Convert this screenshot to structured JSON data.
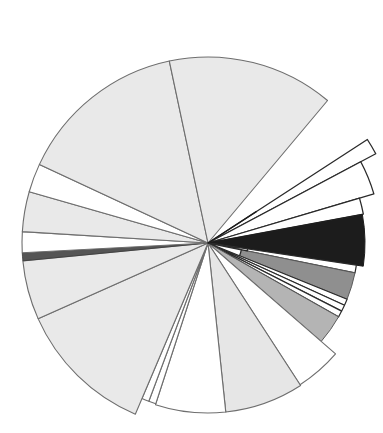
{
  "chart_data": {
    "type": "pie",
    "subtype": "polar-area-rose",
    "title": "",
    "subtitle": "",
    "xlabel": "",
    "ylabel": "",
    "legend": [],
    "annotations": [],
    "grid": false,
    "axis_visible": false,
    "tick_labels": [],
    "center": {
      "x": 208,
      "y": 243
    },
    "angle_units": "degrees",
    "angle_reference": "0 = east (right), increasing clockwise in screen space",
    "radius_units": "pixels",
    "radius_max": 190,
    "background_color": "#ffffff",
    "stroke_color": "#6e6e6e",
    "stroke_width": 1.1,
    "categories": [
      "S1",
      "S2",
      "S3",
      "S4",
      "S5",
      "S6",
      "S7",
      "S8",
      "S9",
      "S10",
      "S11",
      "S12",
      "S13",
      "S14",
      "S15",
      "S16",
      "S17",
      "S18",
      "S19",
      "S20",
      "S21",
      "S22",
      "S23"
    ],
    "series": [
      {
        "name": "radius",
        "values": [
          4,
          152,
          156,
          133,
          4,
          4,
          4,
          4,
          4,
          4,
          4,
          4,
          172,
          186,
          170,
          4,
          181,
          172,
          6,
          97,
          186,
          183,
          186
        ]
      },
      {
        "name": "angle_start",
        "values": [
          -32,
          -28,
          -17,
          -10,
          -6.5,
          -5.5,
          -4.0,
          -2.5,
          -1.0,
          0.5,
          2.0,
          3.5,
          5.0,
          23,
          41,
          57,
          58.5,
          82,
          105,
          108,
          113,
          156,
          204
        ]
      },
      {
        "name": "angle_end",
        "values": [
          -28,
          -17,
          -10,
          -6.5,
          -5.5,
          -4.0,
          -2.5,
          -1.0,
          0.5,
          2.0,
          3.5,
          5.0,
          23,
          41,
          57,
          58.5,
          82,
          105,
          108,
          113,
          156,
          204,
          312
        ]
      },
      {
        "name": "fill",
        "values": [
          "#ffffff",
          "#ffffff",
          "#ffffff",
          "#1c1c1c",
          "#ffffff",
          "#ffffff",
          "#ffffff",
          "#ffffff",
          "#ffffff",
          "#ffffff",
          "#ffffff",
          "#ffffff",
          "#8f8f8f",
          "#b4b4b4",
          "#ffffff",
          "#ffffff",
          "#e4e4e4",
          "#ffffff",
          "#ffffff",
          "#e6e6e6",
          "#e9e9e9",
          "#ffffff",
          "#e9e9e9"
        ]
      }
    ],
    "palette": {
      "black": "#1c1c1c",
      "dark_gray": "#8f8f8f",
      "mid_gray": "#b4b4b4",
      "light_gray": "#e6e6e6",
      "pale_gray": "#e9e9e9",
      "white": "#ffffff",
      "outline": "#6e6e6e"
    },
    "segments": [
      {
        "id": "seg-01",
        "label": "S1",
        "a0": -33.0,
        "a1": -28.0,
        "r": 190,
        "fill": "#ffffff",
        "stroke": "#2a2a2a",
        "stroke_width": 1.3
      },
      {
        "id": "seg-02",
        "label": "S2",
        "a0": -28.0,
        "a1": -16.5,
        "r": 173,
        "fill": "#ffffff",
        "stroke": "#2a2a2a",
        "stroke_width": 1.3
      },
      {
        "id": "seg-03",
        "label": "S3",
        "a0": -16.5,
        "a1": -10.5,
        "r": 158,
        "fill": "#ffffff",
        "stroke": "#2a2a2a",
        "stroke_width": 1.3
      },
      {
        "id": "seg-04",
        "label": "S4",
        "a0": -10.5,
        "a1": 8.5,
        "r": 157,
        "fill": "#1c1c1c",
        "stroke": "#1c1c1c",
        "stroke_width": 1.0
      },
      {
        "id": "seg-05",
        "label": "S5",
        "a0": 8.5,
        "a1": 11.5,
        "r": 150,
        "fill": "#ffffff",
        "stroke": "#2a2a2a",
        "stroke_width": 1.2
      },
      {
        "id": "seg-06",
        "label": "S6",
        "a0": 11.5,
        "a1": 22.0,
        "r": 150,
        "fill": "#8f8f8f",
        "stroke": "#5a5a5a",
        "stroke_width": 1.0
      },
      {
        "id": "seg-07",
        "label": "S7",
        "a0": 22.0,
        "a1": 24.5,
        "r": 150,
        "fill": "#ffffff",
        "stroke": "#2a2a2a",
        "stroke_width": 1.2
      },
      {
        "id": "seg-08",
        "label": "S8",
        "a0": 24.5,
        "a1": 27.0,
        "r": 150,
        "fill": "#ffffff",
        "stroke": "#2a2a2a",
        "stroke_width": 1.2
      },
      {
        "id": "seg-09",
        "label": "S9",
        "a0": 27.0,
        "a1": 29.5,
        "r": 150,
        "fill": "#ffffff",
        "stroke": "#2a2a2a",
        "stroke_width": 1.2
      },
      {
        "id": "seg-10",
        "label": "S10",
        "a0": 29.5,
        "a1": 41.0,
        "r": 150,
        "fill": "#b4b4b4",
        "stroke": "#5a5a5a",
        "stroke_width": 1.0
      },
      {
        "id": "seg-11",
        "label": "S11",
        "a0": 41.0,
        "a1": 57.0,
        "r": 169,
        "fill": "#ffffff",
        "stroke": "#6e6e6e",
        "stroke_width": 1.1
      },
      {
        "id": "seg-12",
        "label": "S12",
        "a0": 57.0,
        "a1": 84.0,
        "r": 170,
        "fill": "#e6e6e6",
        "stroke": "#6e6e6e",
        "stroke_width": 1.1
      },
      {
        "id": "seg-13",
        "label": "S13",
        "a0": 84.0,
        "a1": 108.0,
        "r": 170,
        "fill": "#ffffff",
        "stroke": "#6e6e6e",
        "stroke_width": 1.1
      },
      {
        "id": "seg-14",
        "label": "S14",
        "a0": 108.0,
        "a1": 110.5,
        "r": 169,
        "fill": "#ffffff",
        "stroke": "#6e6e6e",
        "stroke_width": 1.1
      },
      {
        "id": "seg-15",
        "label": "S15",
        "a0": 110.5,
        "a1": 113.0,
        "r": 169,
        "fill": "#ffffff",
        "stroke": "#6e6e6e",
        "stroke_width": 1.1
      },
      {
        "id": "seg-16",
        "label": "S16",
        "a0": 113.0,
        "a1": 156.0,
        "r": 186,
        "fill": "#e9e9e9",
        "stroke": "#6e6e6e",
        "stroke_width": 1.1
      },
      {
        "id": "seg-17",
        "label": "S17",
        "a0": 156.0,
        "a1": 174.5,
        "r": 186,
        "fill": "#e9e9e9",
        "stroke": "#6e6e6e",
        "stroke_width": 1.1
      },
      {
        "id": "seg-18",
        "label": "S18",
        "a0": 174.5,
        "a1": 177.0,
        "r": 186,
        "fill": "#555555",
        "stroke": "#3a3a3a",
        "stroke_width": 0.8
      },
      {
        "id": "seg-19",
        "label": "S19",
        "a0": 177.0,
        "a1": 183.5,
        "r": 186,
        "fill": "#ffffff",
        "stroke": "#6e6e6e",
        "stroke_width": 1.1
      },
      {
        "id": "seg-20",
        "label": "S20",
        "a0": 183.5,
        "a1": 196.0,
        "r": 186,
        "fill": "#e9e9e9",
        "stroke": "#6e6e6e",
        "stroke_width": 1.1
      },
      {
        "id": "seg-21",
        "label": "S21",
        "a0": 196.0,
        "a1": 205.0,
        "r": 186,
        "fill": "#ffffff",
        "stroke": "#6e6e6e",
        "stroke_width": 1.1
      },
      {
        "id": "seg-22",
        "label": "S22",
        "a0": 205.0,
        "a1": 258.0,
        "r": 186,
        "fill": "#e9e9e9",
        "stroke": "#6e6e6e",
        "stroke_width": 1.1
      },
      {
        "id": "seg-23",
        "label": "S23",
        "a0": 258.0,
        "a1": 310.0,
        "r": 186,
        "fill": "#e9e9e9",
        "stroke": "#6e6e6e",
        "stroke_width": 1.1
      }
    ],
    "inner_steps": [
      {
        "id": "step-a",
        "a0": 8.5,
        "a1": 11.5,
        "r": 40,
        "fill": "#ffffff",
        "stroke": "#2a2a2a",
        "stroke_width": 1.3
      },
      {
        "id": "step-b",
        "a0": 11.5,
        "a1": 22.0,
        "r": 34,
        "fill": "#ffffff",
        "stroke": "#2a2a2a",
        "stroke_width": 1.3
      }
    ],
    "spokes": [
      {
        "id": "spoke-1",
        "angle": -33.0,
        "r0": 0,
        "r1": 58,
        "stroke": "#1c1c1c",
        "stroke_width": 1.4
      }
    ]
  },
  "figure": {
    "width": 383,
    "height": 433,
    "background": "#ffffff"
  }
}
